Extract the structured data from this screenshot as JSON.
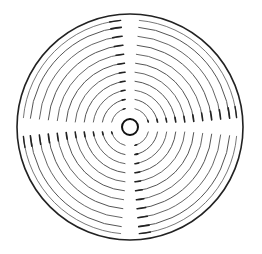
{
  "diagram": {
    "type": "concentric-ring-pattern",
    "center": [
      130,
      127
    ],
    "outer_circle": {
      "r": 113,
      "stroke": "#222222",
      "width": 1.6
    },
    "inner_circle": {
      "r": 8,
      "stroke": "#111111",
      "width": 2.0
    },
    "rings": [
      {
        "r": 19,
        "width": 0.9
      },
      {
        "r": 28,
        "width": 1.0
      },
      {
        "r": 37,
        "width": 0.9
      },
      {
        "r": 46,
        "width": 1.0
      },
      {
        "r": 55,
        "width": 0.9
      },
      {
        "r": 64,
        "width": 1.0
      },
      {
        "r": 73,
        "width": 0.9
      },
      {
        "r": 82,
        "width": 1.0
      },
      {
        "r": 91,
        "width": 0.9
      },
      {
        "r": 100,
        "width": 1.0
      },
      {
        "r": 107,
        "width": 0.8
      }
    ],
    "ring_stroke": "#555555",
    "gap_degrees": 5,
    "gap_positions": [
      "top",
      "right",
      "bottom",
      "left"
    ]
  },
  "caption": ""
}
